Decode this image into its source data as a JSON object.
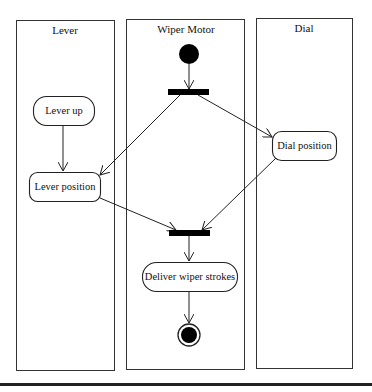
{
  "diagram": {
    "type": "UML activity diagram with swimlanes",
    "lanes": [
      {
        "id": "lever",
        "title": "Lever"
      },
      {
        "id": "wiper",
        "title": "Wiper Motor"
      },
      {
        "id": "dial",
        "title": "Dial"
      }
    ],
    "nodes": {
      "start": {
        "kind": "initial",
        "lane": "wiper"
      },
      "fork": {
        "kind": "fork",
        "lane": "wiper"
      },
      "lever_up": {
        "kind": "action",
        "lane": "lever",
        "label": "Lever up"
      },
      "lever_position": {
        "kind": "action",
        "lane": "lever",
        "label": "Lever position"
      },
      "dial_position": {
        "kind": "action",
        "lane": "dial",
        "label": "Dial position"
      },
      "join": {
        "kind": "join",
        "lane": "wiper"
      },
      "deliver": {
        "kind": "action",
        "lane": "wiper",
        "label": "Deliver wiper strokes"
      },
      "end": {
        "kind": "final",
        "lane": "wiper"
      }
    },
    "edges": [
      {
        "from": "start",
        "to": "fork"
      },
      {
        "from": "fork",
        "to": "lever_position"
      },
      {
        "from": "fork",
        "to": "dial_position"
      },
      {
        "from": "lever_up",
        "to": "lever_position"
      },
      {
        "from": "lever_position",
        "to": "join"
      },
      {
        "from": "dial_position",
        "to": "join"
      },
      {
        "from": "join",
        "to": "deliver"
      },
      {
        "from": "deliver",
        "to": "end"
      }
    ]
  }
}
